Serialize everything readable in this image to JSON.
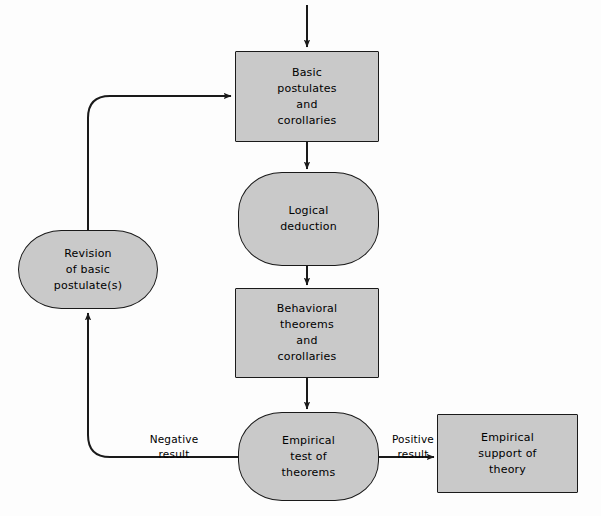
{
  "diagram": {
    "type": "flowchart",
    "canvas": {
      "width": 601,
      "height": 516
    },
    "colors": {
      "node_fill": "#c9c9c9",
      "node_stroke": "#1a1a1a",
      "edge_stroke": "#1a1a1a",
      "background": "#fdfdfd",
      "text": "#000000"
    },
    "nodes": [
      {
        "id": "basic-postulates",
        "label": "Basic\npostulates\nand\ncorollaries",
        "shape": "rectangle",
        "x": 235,
        "y": 51,
        "width": 144,
        "height": 91
      },
      {
        "id": "logical-deduction",
        "label": "Logical\ndeduction",
        "shape": "stadium",
        "x": 238,
        "y": 172,
        "width": 141,
        "height": 94
      },
      {
        "id": "behavioral-theorems",
        "label": "Behavioral\ntheorems\nand\ncorollaries",
        "shape": "rectangle",
        "x": 235,
        "y": 288,
        "width": 144,
        "height": 90
      },
      {
        "id": "empirical-test",
        "label": "Empirical\ntest of\ntheorems",
        "shape": "stadium",
        "x": 238,
        "y": 412,
        "width": 141,
        "height": 89
      },
      {
        "id": "revision-postulates",
        "label": "Revision\nof basic\npostulate(s)",
        "shape": "stadium",
        "x": 18,
        "y": 230,
        "width": 140,
        "height": 79
      },
      {
        "id": "empirical-support",
        "label": "Empirical\nsupport of\ntheory",
        "shape": "rectangle",
        "x": 437,
        "y": 414,
        "width": 141,
        "height": 79
      }
    ],
    "edges": [
      {
        "id": "edge-input-to-postulates",
        "from": "",
        "to": "basic-postulates",
        "label": ""
      },
      {
        "id": "edge-postulates-to-deduction",
        "from": "basic-postulates",
        "to": "logical-deduction",
        "label": ""
      },
      {
        "id": "edge-deduction-to-theorems",
        "from": "logical-deduction",
        "to": "behavioral-theorems",
        "label": ""
      },
      {
        "id": "edge-theorems-to-test",
        "from": "behavioral-theorems",
        "to": "empirical-test",
        "label": ""
      },
      {
        "id": "edge-test-to-support",
        "from": "empirical-test",
        "to": "empirical-support",
        "label": "Positive\nresult",
        "label_x": 384,
        "label_y": 432
      },
      {
        "id": "edge-test-to-revision",
        "from": "empirical-test",
        "to": "revision-postulates",
        "label": "Negative\nresult",
        "label_x": 173,
        "label_y": 432
      },
      {
        "id": "edge-revision-to-postulates",
        "from": "revision-postulates",
        "to": "basic-postulates",
        "label": ""
      }
    ]
  }
}
